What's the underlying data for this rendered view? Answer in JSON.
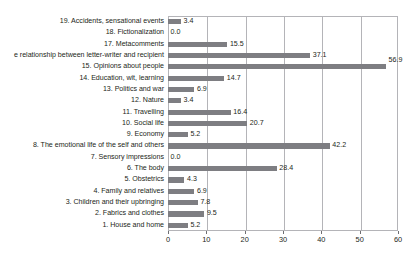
{
  "title_remnant": "·            ·                     ·                                                    ·",
  "colors": {
    "bar": "#7e7e82",
    "axis": "#b4b4b8",
    "text": "#231f20",
    "background": "#ffffff"
  },
  "chart_data": {
    "type": "bar",
    "orientation": "horizontal",
    "title": "",
    "xlabel": "",
    "ylabel": "",
    "xlim": [
      0,
      60
    ],
    "xticks": [
      0,
      10,
      20,
      30,
      40,
      50,
      60
    ],
    "xtick_labels": [
      "0",
      "10",
      "20",
      "30",
      "40",
      "50",
      "60"
    ],
    "grid": true,
    "grid_axis": "x",
    "legend": "none",
    "categories": [
      "19. Accidents, sensational events",
      "18. Fictionalization",
      "17. Metacomments",
      "e relationship between letter-writer and recipient",
      "15. Opinions about people",
      "14. Education, wit, learning",
      "13. Politics and war",
      "12. Nature",
      "11. Travelling",
      "10. Social life",
      "9. Economy",
      "8. The emotional life of the self and others",
      "7. Sensory impressions",
      "6. The body",
      "5. Obstetrics",
      "4. Family and relatives",
      "3. Children and their upbringing",
      "2. Fabrics and clothes",
      "1. House and home"
    ],
    "values": [
      3.4,
      0.0,
      15.5,
      37.1,
      56.9,
      14.7,
      6.9,
      3.4,
      16.4,
      20.7,
      5.2,
      42.2,
      0.0,
      28.4,
      4.3,
      6.9,
      7.8,
      9.5,
      5.2
    ],
    "value_labels": [
      "3.4",
      "0.0",
      "15.5",
      "37.1",
      "56.9",
      "14.7",
      "6.9",
      "3.4",
      "16.4",
      "20.7",
      "5.2",
      "42.2",
      "0.0",
      "28.4",
      "4.3",
      "6.9",
      "7.8",
      "9.5",
      "5.2"
    ],
    "label_above_bar": [
      false,
      false,
      false,
      false,
      true,
      false,
      false,
      false,
      false,
      false,
      false,
      false,
      false,
      false,
      false,
      false,
      false,
      false,
      false
    ],
    "label_clipped": [
      false,
      false,
      false,
      true,
      false,
      false,
      false,
      false,
      false,
      false,
      false,
      false,
      false,
      false,
      false,
      false,
      false,
      false,
      false
    ]
  }
}
